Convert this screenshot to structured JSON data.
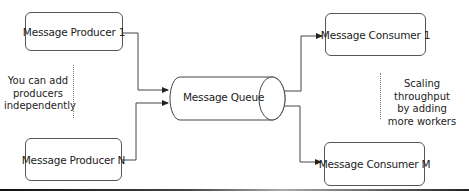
{
  "diagram": {
    "producers": [
      {
        "label": "Message Producer 1"
      },
      {
        "label": "Message Producer N"
      }
    ],
    "queue": {
      "label": "Message Queue"
    },
    "consumers": [
      {
        "label": "Message Consumer 1"
      },
      {
        "label": "Message Consumer M"
      }
    ],
    "notes": {
      "left": [
        "You can add",
        "producers",
        "independently"
      ],
      "right": [
        "Scaling throughput",
        "by adding",
        "more workers"
      ]
    },
    "colors": {
      "stroke": "#444444",
      "background": "#ffffff"
    }
  }
}
